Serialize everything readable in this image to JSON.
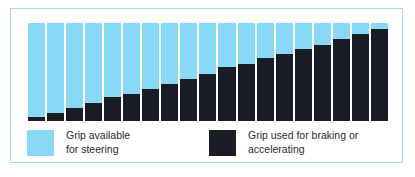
{
  "figure": {
    "frame_border_color": "#a9d6ea",
    "background_color": "#ffffff"
  },
  "legend": {
    "entries": [
      {
        "swatch_name": "legend-swatch-grip-available",
        "color": "#89d8f5",
        "line1": "Grip available",
        "line2": "for steering"
      },
      {
        "swatch_name": "legend-swatch-grip-used",
        "color": "#1a1d26",
        "line1": "Grip used for braking or",
        "line2": "accelerating"
      }
    ]
  },
  "chart_data": {
    "type": "bar",
    "subtype": "stacked-bar",
    "title": "",
    "xlabel": "",
    "ylabel": "",
    "ylim": [
      0,
      100
    ],
    "grid": false,
    "legend_position": "bottom",
    "stack_order": [
      "Grip used for braking or accelerating",
      "Grip available for steering"
    ],
    "categories": [
      "1",
      "2",
      "3",
      "4",
      "5",
      "6",
      "7",
      "8",
      "9",
      "10",
      "11",
      "12",
      "13",
      "14",
      "15",
      "16",
      "17",
      "18",
      "19"
    ],
    "series": [
      {
        "name": "Grip used for braking or accelerating",
        "color": "#1a1d26",
        "values": [
          4,
          8,
          13,
          18,
          24,
          28,
          33,
          38,
          43,
          48,
          55,
          58,
          64,
          68,
          73,
          78,
          84,
          89,
          94
        ]
      },
      {
        "name": "Grip available for steering",
        "color": "#89d8f5",
        "values": [
          96,
          92,
          87,
          82,
          76,
          72,
          67,
          62,
          57,
          52,
          45,
          42,
          36,
          32,
          27,
          22,
          16,
          11,
          6
        ]
      }
    ]
  }
}
